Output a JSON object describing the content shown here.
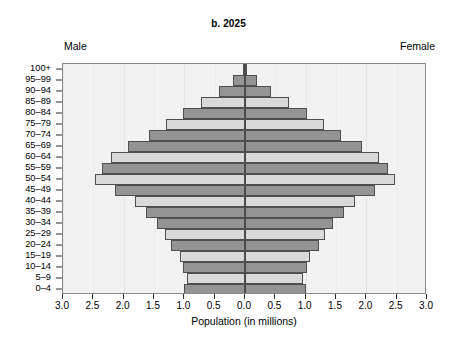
{
  "chart_data": {
    "type": "bar",
    "subtype": "population-pyramid",
    "title": "b. 2025",
    "xlabel": "Population (in millions)",
    "ylabel": "",
    "xlim": [
      -3.0,
      3.0
    ],
    "x_tick_labels": [
      "3.0",
      "2.5",
      "2.0",
      "1.5",
      "1.0",
      "0.5",
      "0.0",
      "0.5",
      "1.0",
      "1.5",
      "2.0",
      "2.5",
      "3.0"
    ],
    "x_tick_values": [
      -3.0,
      -2.5,
      -2.0,
      -1.5,
      -1.0,
      -0.5,
      0.0,
      0.5,
      1.0,
      1.5,
      2.0,
      2.5,
      3.0
    ],
    "grid": true,
    "legend_position": "none",
    "side_labels": {
      "left": "Male",
      "right": "Female"
    },
    "categories": [
      "100+",
      "95–99",
      "90–94",
      "85–89",
      "80–84",
      "75–79",
      "70–74",
      "65–69",
      "60–64",
      "55–59",
      "50–54",
      "45–49",
      "40–44",
      "35–39",
      "30–34",
      "25–29",
      "20–24",
      "15–19",
      "10–14",
      "5–9",
      "0–4"
    ],
    "series": [
      {
        "name": "Male",
        "side": "left",
        "unit": "millions",
        "values": [
          0.04,
          0.19,
          0.43,
          0.72,
          1.03,
          1.31,
          1.59,
          1.93,
          2.21,
          2.35,
          2.47,
          2.14,
          1.82,
          1.63,
          1.45,
          1.32,
          1.22,
          1.07,
          1.02,
          0.96,
          1.0
        ]
      },
      {
        "name": "Female",
        "side": "right",
        "unit": "millions",
        "values": [
          0.04,
          0.19,
          0.43,
          0.72,
          1.03,
          1.31,
          1.59,
          1.93,
          2.21,
          2.35,
          2.47,
          2.14,
          1.82,
          1.63,
          1.45,
          1.32,
          1.22,
          1.07,
          1.02,
          0.96,
          1.0
        ]
      }
    ],
    "bar_shades": [
      "dark",
      "dark",
      "dark",
      "light",
      "dark",
      "light",
      "dark",
      "dark",
      "light",
      "dark",
      "light",
      "dark",
      "light",
      "dark",
      "dark",
      "light",
      "dark",
      "light",
      "dark",
      "light",
      "dark"
    ],
    "colors": {
      "shade_light": "#d9d9d9",
      "shade_dark": "#949494",
      "bar_outline": "#4f4f4f",
      "plot_background": "#f2f2f2",
      "gridline": "#e6e6e6",
      "centerline": "#4a4a4a",
      "axis": "#2b2b2b",
      "text": "#000000"
    }
  }
}
